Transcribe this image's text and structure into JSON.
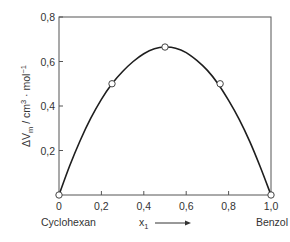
{
  "chart_data": {
    "type": "line",
    "title": "",
    "xlabel": "x₁",
    "xlabel_arrow": "→",
    "ylabel": "ΔV_m / cm³ · mol⁻¹",
    "ylabel_parts": {
      "delta_v": "ΔV",
      "sub": "m",
      "unit": " / cm",
      "sup3": "3",
      "mid": " · mol",
      "supneg": "−1"
    },
    "xlim": [
      0,
      1.0
    ],
    "ylim": [
      0,
      0.8
    ],
    "x_ticks": [
      0,
      0.2,
      0.4,
      0.6,
      0.8,
      1.0
    ],
    "x_tick_labels": [
      "0",
      "0,2",
      "0,4",
      "0,6",
      "0,8",
      "1,0"
    ],
    "y_ticks": [
      0.2,
      0.4,
      0.6,
      0.8
    ],
    "y_tick_labels": [
      "0,2",
      "0,4",
      "0,6",
      "0,8"
    ],
    "x_end_labels": {
      "left": "Cyclohexan",
      "right": "Benzol"
    },
    "grid": false,
    "series": [
      {
        "name": "measured",
        "marker": "open-circle",
        "x": [
          0,
          0.25,
          0.5,
          0.76,
          1.0
        ],
        "y": [
          0,
          0.5,
          0.665,
          0.5,
          0
        ]
      },
      {
        "name": "fit curve",
        "marker": "none",
        "x": [
          0,
          0.05,
          0.1,
          0.15,
          0.2,
          0.25,
          0.3,
          0.35,
          0.4,
          0.45,
          0.5,
          0.55,
          0.6,
          0.65,
          0.7,
          0.75,
          0.8,
          0.85,
          0.9,
          0.95,
          1.0
        ],
        "y": [
          0,
          0.13,
          0.245,
          0.345,
          0.43,
          0.5,
          0.555,
          0.6,
          0.635,
          0.657,
          0.665,
          0.66,
          0.64,
          0.605,
          0.56,
          0.5,
          0.425,
          0.34,
          0.24,
          0.125,
          0
        ]
      }
    ]
  }
}
